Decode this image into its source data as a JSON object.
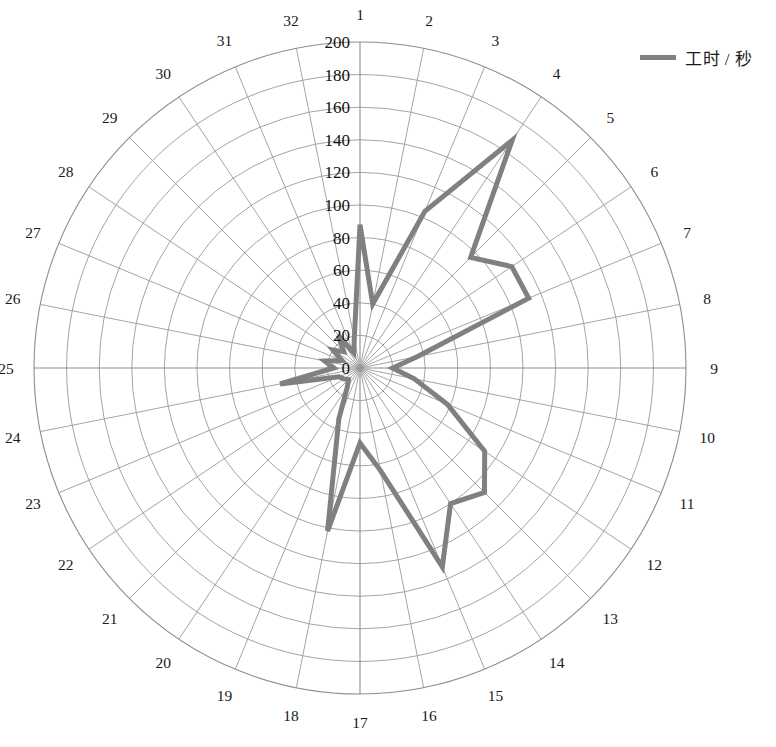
{
  "legend": {
    "position": "top-right",
    "entries": [
      {
        "label": "工时 / 秒",
        "color": "#808080",
        "marker": "line-swatch"
      }
    ]
  },
  "axes": {
    "radial": {
      "min": 0,
      "max": 200,
      "step": 20,
      "ticks": [
        "0",
        "20",
        "40",
        "60",
        "80",
        "100",
        "120",
        "140",
        "160",
        "180",
        "200"
      ]
    },
    "angular": {
      "start_angle_deg": 90,
      "direction": "clockwise",
      "categories": [
        "1",
        "2",
        "3",
        "4",
        "5",
        "6",
        "7",
        "8",
        "9",
        "10",
        "11",
        "12",
        "13",
        "14",
        "15",
        "16",
        "17",
        "18",
        "19",
        "20",
        "21",
        "22",
        "23",
        "24",
        "25",
        "26",
        "27",
        "28",
        "29",
        "30",
        "31",
        "32"
      ]
    }
  },
  "style": {
    "line_color": "#808080",
    "line_width": 5,
    "grid_color": "#9a9a9a",
    "background": "#ffffff",
    "text_color": "#1a1a1a"
  },
  "chart_data": {
    "type": "line",
    "subtype": "polar-radar",
    "title": "",
    "xlabel": "",
    "ylabel": "",
    "ylim": [
      0,
      200
    ],
    "grid": true,
    "legend_position": "top-right",
    "start_angle_deg": 90,
    "direction": "clockwise",
    "categories": [
      "1",
      "2",
      "3",
      "4",
      "5",
      "6",
      "7",
      "8",
      "9",
      "10",
      "11",
      "12",
      "13",
      "14",
      "15",
      "16",
      "17",
      "18",
      "19",
      "20",
      "21",
      "22",
      "23",
      "24",
      "25",
      "26",
      "27",
      "28",
      "29",
      "30",
      "31",
      "32"
    ],
    "series": [
      {
        "name": "工时 / 秒",
        "color": "#808080",
        "values": [
          88,
          40,
          104,
          168,
          96,
          112,
          112,
          36,
          20,
          34,
          58,
          92,
          108,
          100,
          132,
          64,
          46,
          102,
          34,
          14,
          10,
          12,
          14,
          50,
          16,
          22,
          12,
          20,
          14,
          24,
          10,
          18
        ]
      }
    ]
  }
}
